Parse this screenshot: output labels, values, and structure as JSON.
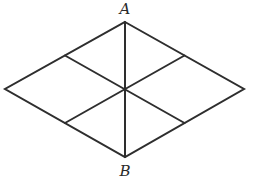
{
  "diagram": {
    "type": "rhombus-subdivided",
    "stroke_color": "#2e2e2e",
    "background": "#ffffff",
    "vertices": {
      "top": {
        "x": 125,
        "y": 22
      },
      "right": {
        "x": 244,
        "y": 89
      },
      "bottom": {
        "x": 125,
        "y": 157
      },
      "left": {
        "x": 5,
        "y": 89
      },
      "center": {
        "x": 125,
        "y": 89
      }
    },
    "side_midpoints": {
      "upper_left": {
        "x": 65,
        "y": 55.5
      },
      "upper_right": {
        "x": 184.5,
        "y": 55.5
      },
      "lower_right": {
        "x": 184.5,
        "y": 123
      },
      "lower_left": {
        "x": 65,
        "y": 123
      }
    },
    "labels": [
      {
        "id": "A",
        "text": "A",
        "x": 125,
        "y": 2
      },
      {
        "id": "B",
        "text": "B",
        "x": 125,
        "y": 164
      }
    ]
  }
}
